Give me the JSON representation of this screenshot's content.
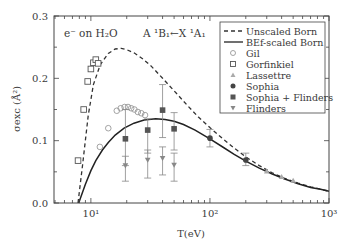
{
  "chart_data": {
    "type": "line",
    "title": "",
    "annotations": [
      {
        "text": "e⁻ on H₂O",
        "name": "target-annotation"
      },
      {
        "text": "A ¹B₁←X ¹A₁",
        "name": "transition-annotation"
      }
    ],
    "xlabel": "T(eV)",
    "ylabel": "σexc (Å²)",
    "xscale": "log",
    "xlim": [
      4.9,
      1000
    ],
    "ylim": [
      0.0,
      0.3
    ],
    "x_ticks": [
      {
        "value": 10,
        "label": "10¹"
      },
      {
        "value": 100,
        "label": "10²"
      },
      {
        "value": 1000,
        "label": "10³"
      }
    ],
    "y_ticks": [
      {
        "value": 0.0,
        "label": "0.0"
      },
      {
        "value": 0.1,
        "label": "0.1"
      },
      {
        "value": 0.2,
        "label": "0.2"
      },
      {
        "value": 0.3,
        "label": "0.3"
      }
    ],
    "legend_position": "upper right",
    "grid": false,
    "series": [
      {
        "name": "Unscaled Born",
        "kind": "line",
        "style": "dashed",
        "color": "#333333",
        "x": [
          7.8,
          8.5,
          9.5,
          10.5,
          12,
          14,
          16,
          18,
          20,
          23,
          27,
          32,
          40,
          50,
          65,
          80,
          100,
          130,
          160,
          200,
          260,
          330,
          420,
          550,
          700,
          850,
          1000
        ],
        "y": [
          0.0,
          0.06,
          0.14,
          0.19,
          0.222,
          0.24,
          0.247,
          0.248,
          0.246,
          0.241,
          0.232,
          0.22,
          0.2,
          0.18,
          0.156,
          0.138,
          0.121,
          0.102,
          0.088,
          0.074,
          0.06,
          0.049,
          0.04,
          0.032,
          0.026,
          0.022,
          0.019
        ]
      },
      {
        "name": "BEf-scaled Born",
        "kind": "line",
        "style": "solid",
        "color": "#222222",
        "x": [
          7.9,
          9,
          10,
          11,
          12.5,
          14,
          16,
          19,
          23,
          28,
          35,
          42,
          50,
          60,
          75,
          100,
          130,
          160,
          200,
          260,
          330,
          420,
          550,
          700,
          850,
          1000
        ],
        "y": [
          0.0,
          0.03,
          0.052,
          0.068,
          0.085,
          0.097,
          0.109,
          0.12,
          0.128,
          0.133,
          0.135,
          0.134,
          0.131,
          0.126,
          0.117,
          0.103,
          0.089,
          0.078,
          0.067,
          0.056,
          0.047,
          0.039,
          0.031,
          0.025,
          0.022,
          0.019
        ]
      },
      {
        "name": "Gil",
        "kind": "scatter",
        "marker": "open-circle",
        "color": "#999999",
        "x": [
          11.9,
          14.0,
          16.5,
          17.8,
          19.2,
          20.5,
          21.8,
          23.2,
          24.8,
          26.5,
          28.5
        ],
        "y": [
          0.09,
          0.12,
          0.148,
          0.152,
          0.154,
          0.154,
          0.152,
          0.15,
          0.146,
          0.144,
          0.141
        ]
      },
      {
        "name": "Gorfinkiel",
        "kind": "scatter",
        "marker": "open-square",
        "color": "#555555",
        "x": [
          7.8,
          8.7,
          9.4,
          10.0,
          10.5,
          11.0,
          11.5
        ],
        "y": [
          0.068,
          0.15,
          0.195,
          0.215,
          0.225,
          0.23,
          0.224
        ]
      },
      {
        "name": "Lassettre",
        "kind": "scatter",
        "marker": "triangle-up",
        "color": "#aaaaaa",
        "x": [
          300,
          400,
          500
        ],
        "y": [
          0.051,
          0.042,
          0.036
        ]
      },
      {
        "name": "Sophia",
        "kind": "scatter",
        "marker": "filled-circle",
        "color": "#444444",
        "x": [
          100,
          200
        ],
        "y": [
          0.104,
          0.069
        ],
        "err_low": [
          0.09,
          0.06
        ],
        "err_high": [
          0.118,
          0.08
        ]
      },
      {
        "name": "Sophia + Flinders",
        "kind": "scatter",
        "marker": "filled-square",
        "color": "#555555",
        "x": [
          19.5,
          30,
          40,
          50
        ],
        "y": [
          0.103,
          0.117,
          0.149,
          0.119
        ],
        "err_low": [
          0.06,
          0.08,
          0.105,
          0.085
        ],
        "err_high": [
          0.15,
          0.135,
          0.19,
          0.145
        ]
      },
      {
        "name": "Flinders",
        "kind": "scatter",
        "marker": "triangle-down",
        "color": "#888888",
        "x": [
          19.5,
          30,
          40,
          50
        ],
        "y": [
          0.06,
          0.069,
          0.072,
          0.061
        ],
        "err_low": [
          0.035,
          0.04,
          0.045,
          0.035
        ],
        "err_high": [
          0.075,
          0.085,
          0.09,
          0.08
        ]
      }
    ]
  }
}
